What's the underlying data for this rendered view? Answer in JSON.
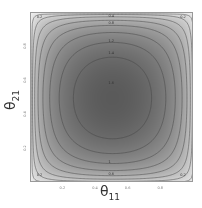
{
  "chart_data": {
    "type": "heatmap",
    "subtype": "filled-contour",
    "title": "",
    "xlabel": "θ11",
    "ylabel": "θ21",
    "xlim": [
      0,
      1
    ],
    "ylim": [
      0,
      1
    ],
    "x_ticks": [
      "0.2",
      "0.4",
      "0.6",
      "0.8"
    ],
    "y_ticks": [
      "0.2",
      "0.4",
      "0.6",
      "0.8"
    ],
    "contour_levels": [
      0.2,
      0.4,
      0.6,
      0.8,
      1.0,
      1.2,
      1.4,
      1.6
    ],
    "contour_labels_visible": [
      "0.2",
      "0.2",
      "0.2",
      "0.2",
      "0.4",
      "0.6",
      "0.8",
      "1",
      "1.2",
      "1.4",
      "1.6"
    ],
    "peak_location": [
      0.5,
      0.5
    ],
    "peak_value_approx": 1.8,
    "colormap": "white-to-dark-gray",
    "legend": "none",
    "grid": false
  },
  "axes": {
    "x_label_main": "θ",
    "x_label_sub": "11",
    "y_label_main": "θ",
    "y_label_sub": "21"
  }
}
